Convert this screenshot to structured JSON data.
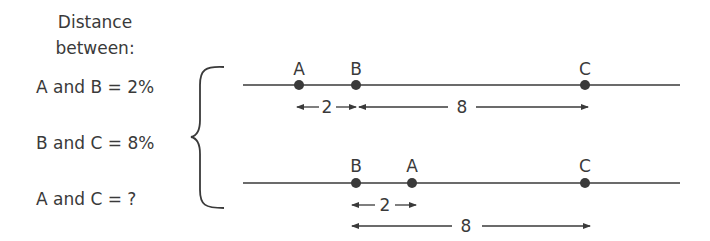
{
  "header": {
    "line1": "Distance",
    "line2": "between:"
  },
  "equations": [
    {
      "label": "A and B = 2%"
    },
    {
      "label": "B and C = 8%"
    },
    {
      "label": "A and C = ?"
    }
  ],
  "top_line": {
    "points": [
      {
        "name": "A",
        "x": 299
      },
      {
        "name": "B",
        "x": 356
      },
      {
        "name": "C",
        "x": 585
      }
    ],
    "distances": [
      {
        "label": "2"
      },
      {
        "label": "8"
      }
    ]
  },
  "bottom_line": {
    "points": [
      {
        "name": "B",
        "x": 356
      },
      {
        "name": "A",
        "x": 412
      },
      {
        "name": "C",
        "x": 585
      }
    ],
    "distances": [
      {
        "label": "2"
      },
      {
        "label": "8"
      }
    ]
  },
  "colors": {
    "ink": "#3a3a3a",
    "background": "#ffffff"
  }
}
